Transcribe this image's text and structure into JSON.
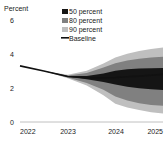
{
  "chart_data": {
    "type": "area",
    "title": "",
    "subtitle": "",
    "ylabel": "Percent",
    "xlabel": "",
    "ylim": [
      0,
      6
    ],
    "xlim": [
      2022,
      2025
    ],
    "grid": false,
    "legend_position": "top-right",
    "y_ticks": [
      "0",
      "2",
      "4",
      "6"
    ],
    "y_tick_values": [
      0,
      2,
      4,
      6
    ],
    "x_ticks": [
      "2022",
      "2023",
      "2024",
      "2025"
    ],
    "x_tick_values": [
      2022,
      2023,
      2024,
      2025
    ],
    "x": [
      2022.0,
      2022.5,
      2023.0,
      2023.4,
      2023.75,
      2024.0,
      2024.25,
      2024.5,
      2024.75,
      2025.0
    ],
    "series": [
      {
        "name": "Baseline",
        "type": "line",
        "color": "#111111",
        "values": [
          3.3,
          3.0,
          2.68,
          2.6,
          2.6,
          2.62,
          2.66,
          2.7,
          2.75,
          2.8
        ]
      },
      {
        "name": "50 percent",
        "type": "band",
        "color": "#151515",
        "lower": [
          3.3,
          3.0,
          2.66,
          2.52,
          2.36,
          2.2,
          2.08,
          1.98,
          1.92,
          1.88
        ],
        "upper": [
          3.3,
          3.0,
          2.7,
          2.7,
          2.86,
          3.02,
          3.1,
          3.14,
          3.16,
          3.18
        ]
      },
      {
        "name": "80 percent",
        "type": "band",
        "color": "#808080",
        "lower": [
          3.3,
          3.0,
          2.62,
          2.3,
          1.9,
          1.5,
          1.26,
          1.1,
          1.0,
          0.96
        ],
        "upper": [
          3.3,
          3.0,
          2.74,
          2.88,
          3.2,
          3.46,
          3.62,
          3.72,
          3.8,
          3.84
        ]
      },
      {
        "name": "90 percent",
        "type": "band",
        "color": "#bfbfbf",
        "lower": [
          3.3,
          3.0,
          2.58,
          2.14,
          1.58,
          1.08,
          0.86,
          0.7,
          0.58,
          0.5
        ],
        "upper": [
          3.3,
          3.0,
          2.78,
          3.02,
          3.44,
          3.8,
          4.02,
          4.18,
          4.3,
          4.38
        ]
      }
    ]
  },
  "axes": {
    "ylabel": "Percent",
    "y_ticks": [
      "6",
      "4",
      "2",
      "0"
    ],
    "x_ticks": [
      "2022",
      "2023",
      "2024",
      "2025"
    ]
  },
  "legend": {
    "items": [
      {
        "label": "50 percent",
        "color": "#151515",
        "marker": "square-swatch"
      },
      {
        "label": "80 percent",
        "color": "#808080",
        "marker": "square-swatch"
      },
      {
        "label": "90 percent",
        "color": "#bfbfbf",
        "marker": "square-swatch"
      },
      {
        "label": "Baseline",
        "color": "#111111",
        "marker": "line-swatch"
      }
    ]
  }
}
